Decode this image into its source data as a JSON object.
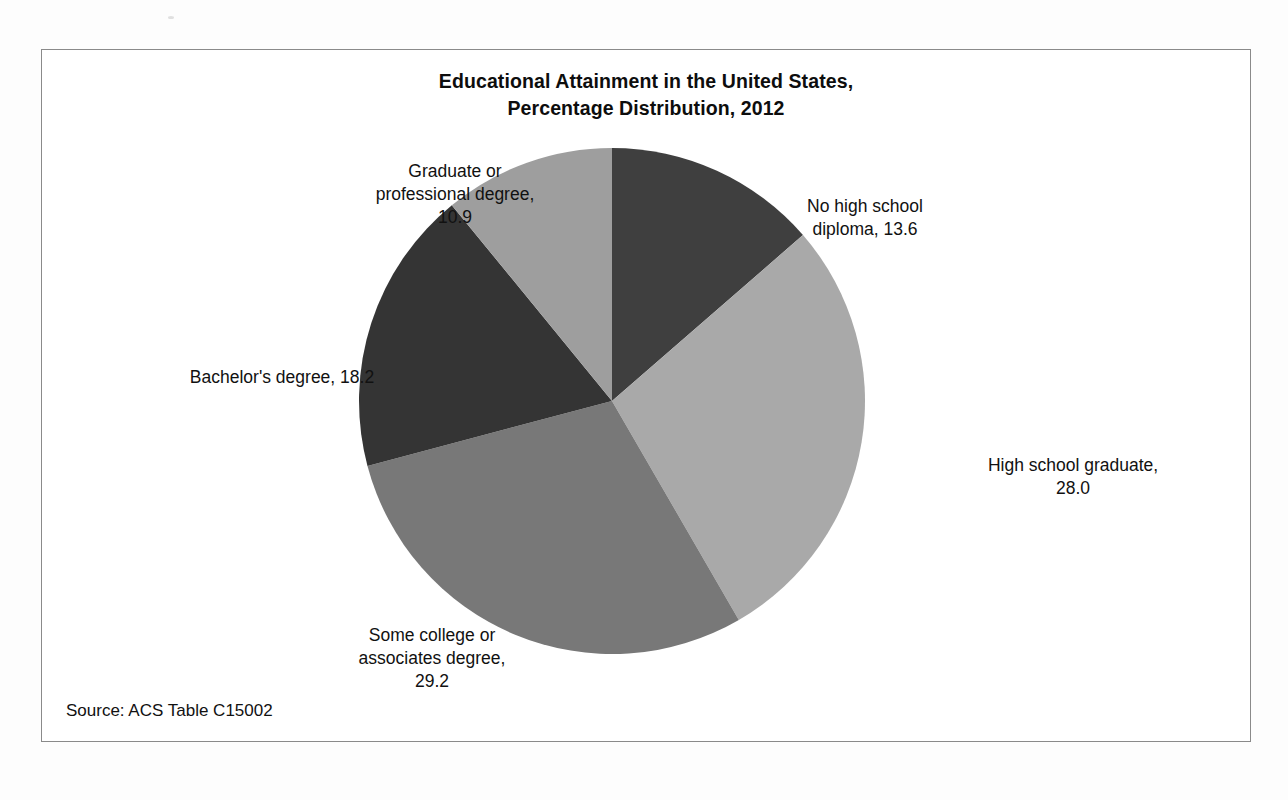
{
  "document": {
    "source_note": "Source: ACS Table C15002"
  },
  "chart_data": {
    "type": "pie",
    "title": "Educational Attainment in the United States,\nPercentage Distribution, 2012",
    "title_line1": "Educational Attainment in the United States,",
    "title_line2": "Percentage Distribution, 2012",
    "xlabel": "",
    "ylabel": "",
    "legend_position": "none",
    "grid": false,
    "units": "percent",
    "start_angle_deg": 0,
    "direction": "clockwise",
    "categories": [
      "No high school diploma",
      "High school graduate",
      "Some college or associates degree",
      "Bachelor's degree",
      "Graduate or professional degree"
    ],
    "values": [
      13.6,
      28.0,
      29.2,
      18.2,
      10.9
    ],
    "labels": [
      "No high school\ndiploma, 13.6",
      "High school graduate,\n28.0",
      "Some college or\nassociates degree,\n29.2",
      "Bachelor's degree, 18.2",
      "Graduate or\nprofessional degree,\n10.9"
    ],
    "colors": [
      "#3f3f3f",
      "#a9a9a9",
      "#787878",
      "#343434",
      "#9e9e9e"
    ],
    "slice_colors": {
      "no_high_school_diploma": "#3f3f3f",
      "high_school_graduate": "#a9a9a9",
      "some_college_or_associates_degree": "#787878",
      "bachelors_degree": "#343434",
      "graduate_or_professional_degree": "#9e9e9e"
    },
    "frame_color": "#8a8a8a",
    "background_color": "#ffffff"
  }
}
